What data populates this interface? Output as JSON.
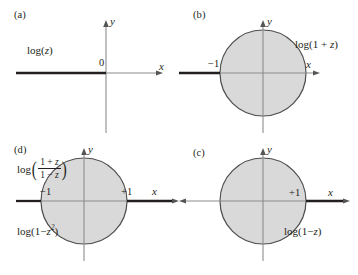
{
  "figure": {
    "colors": {
      "disk_fill": "#d9d9d9",
      "disk_stroke": "#4d4d4d",
      "axis": "#888888",
      "cut": "#231f20",
      "text": "#231f20"
    }
  },
  "panels": [
    {
      "id": "a",
      "letter": "(a)",
      "function_label": "log(z)",
      "function_label_log": "log(",
      "function_label_var": "z",
      "function_label_close": ")",
      "origin_label": "0",
      "x_axis_label": "x",
      "y_axis_label": "y",
      "has_disk": false,
      "cut_side": "left",
      "branch_point": "0",
      "tick_labels": []
    },
    {
      "id": "b",
      "letter": "(b)",
      "function_label": "log(1 + z)",
      "function_label_prefix": "log(1 + ",
      "function_label_var": "z",
      "function_label_close": ")",
      "x_axis_label": "x",
      "y_axis_label": "y",
      "has_disk": true,
      "cut_side": "left",
      "branch_point": "-1",
      "tick_labels": [
        "−1"
      ]
    },
    {
      "id": "c",
      "letter": "(c)",
      "function_label": "log(1−z)",
      "function_label_prefix": "log(1−",
      "function_label_var": "z",
      "function_label_close": ")",
      "x_axis_label": "x",
      "y_axis_label": "y",
      "has_disk": true,
      "cut_side": "right",
      "branch_point": "+1",
      "tick_labels": [
        "+1"
      ]
    },
    {
      "id": "d",
      "letter": "(d)",
      "function_label_fraction": {
        "log": "log",
        "open_paren": "(",
        "numerator_prefix": "1 + ",
        "numerator_var": "z",
        "denominator_prefix": "1 − ",
        "denominator_var": "z",
        "close_paren": ")"
      },
      "second_function_label": "log(1−z²)",
      "second_label_prefix": "log(1−",
      "second_label_var": "z",
      "second_label_sup": "2",
      "second_label_close": ")",
      "x_axis_label": "x",
      "y_axis_label": "y",
      "has_disk": true,
      "cut_side": "both",
      "branch_points": [
        "-1",
        "+1"
      ],
      "tick_labels": [
        "−1",
        "+1"
      ]
    }
  ]
}
